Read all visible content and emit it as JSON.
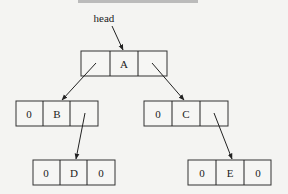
{
  "diagram": {
    "type": "binary-tree-linked-list",
    "head_label": "head",
    "nodes": [
      {
        "id": "A",
        "x": 81,
        "y": 51,
        "cells": [
          "",
          "A",
          ""
        ]
      },
      {
        "id": "B",
        "x": 16,
        "y": 101,
        "cells": [
          "0",
          "B",
          ""
        ]
      },
      {
        "id": "C",
        "x": 144,
        "y": 101,
        "cells": [
          "0",
          "C",
          ""
        ]
      },
      {
        "id": "D",
        "x": 33,
        "y": 160,
        "cells": [
          "0",
          "D",
          "0"
        ]
      },
      {
        "id": "E",
        "x": 188,
        "y": 160,
        "cells": [
          "0",
          "E",
          "0"
        ]
      }
    ],
    "edges": [
      {
        "from": "head",
        "to": "A"
      },
      {
        "from": "A.left",
        "to": "B"
      },
      {
        "from": "A.right",
        "to": "C"
      },
      {
        "from": "B.right",
        "to": "D"
      },
      {
        "from": "C.right",
        "to": "E"
      }
    ],
    "colors": {
      "line": "#222222",
      "background": "#f4f4f2"
    }
  }
}
